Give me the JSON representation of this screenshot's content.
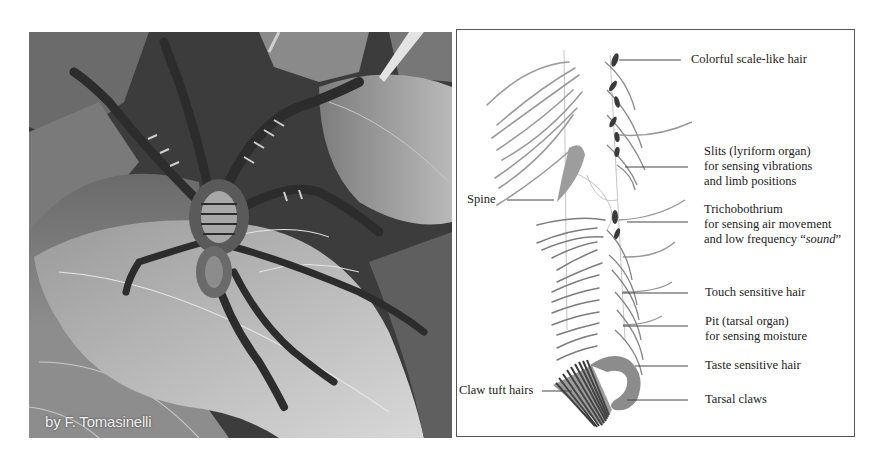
{
  "figure": {
    "photo": {
      "alt": "Wandering spider resting on leaves (black and white photograph)",
      "credit": "by F. Tomasinelli"
    },
    "diagram": {
      "title": "Sensory structures on a spider leg",
      "labels": {
        "scale_hair": "Colorful scale-like hair",
        "slits": [
          "Slits (lyriform organ)",
          "for sensing vibrations",
          "and limb positions"
        ],
        "spine": "Spine",
        "trichobothrium": [
          "Trichobothrium",
          "for sensing air movement",
          "and low frequency “",
          "sound",
          "”"
        ],
        "touch": "Touch sensitive hair",
        "pit": [
          "Pit (tarsal organ)",
          "for sensing moisture"
        ],
        "taste": "Taste sensitive hair",
        "claw_tuft": "Claw tuft hairs",
        "tarsal_claws": "Tarsal claws"
      }
    }
  }
}
